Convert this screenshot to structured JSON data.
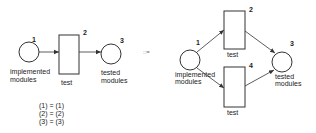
{
  "left_net": {
    "place_1": {
      "number": "1",
      "label_line1": "implemented",
      "label_line2": "modules"
    },
    "transition_2": {
      "number": "2",
      "label": "test"
    },
    "place_3": {
      "number": "3",
      "label_line1": "tested",
      "label_line2": "modules"
    }
  },
  "equations": [
    "(1) = (1)",
    "(2) = (2)",
    "(3) = (3)"
  ],
  "refinement_symbol": "::=",
  "right_net": {
    "place_1": {
      "number": "1",
      "label_line1": "implemented",
      "label_line2": "modules"
    },
    "transition_2": {
      "number": "2",
      "label": "test"
    },
    "transition_4": {
      "number": "4",
      "label": "test"
    },
    "place_3": {
      "number": "3",
      "label_line1": "tested",
      "label_line2": "modules"
    }
  }
}
